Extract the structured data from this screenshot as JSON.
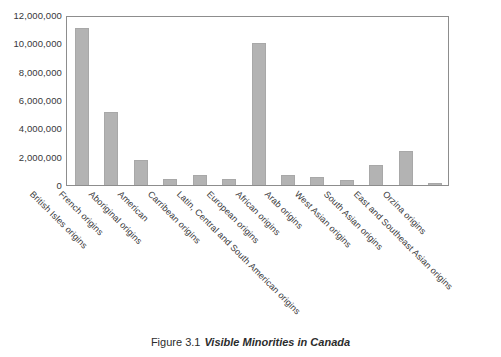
{
  "figure": {
    "caption_number": "Figure 3.1",
    "caption_title": "Visible Minorities in Canada"
  },
  "colors": {
    "bar_fill": "#b3b3b3",
    "bar_edge": "#a8a8a8",
    "frame": "#8d8d8d",
    "text": "#2b2b2b",
    "background": "#ffffff"
  },
  "chart_data": {
    "type": "bar",
    "title": "",
    "xlabel": "",
    "ylabel": "",
    "ylim": [
      0,
      12000000
    ],
    "ytick_labels": [
      "12,000,000",
      "10,000,000",
      "8,000,000",
      "6,000,000",
      "4,000,000",
      "2,000,000",
      "0"
    ],
    "yticks": [
      12000000,
      10000000,
      8000000,
      6000000,
      4000000,
      2000000,
      0
    ],
    "grid": false,
    "legend": false,
    "categories": [
      "British Isles origins",
      "French origins",
      "Aboriginal origins",
      "American",
      "Carribean origins",
      "Latin, Central and South American origins",
      "European origins",
      "African origins",
      "Arab origins",
      "West Asian origins",
      "South Asian origins",
      "East and Southeast Asian origins",
      "Orzina origins"
    ],
    "values": [
      11100000,
      5150000,
      1800000,
      400000,
      700000,
      400000,
      10050000,
      700000,
      550000,
      350000,
      1400000,
      2400000,
      100000
    ]
  }
}
